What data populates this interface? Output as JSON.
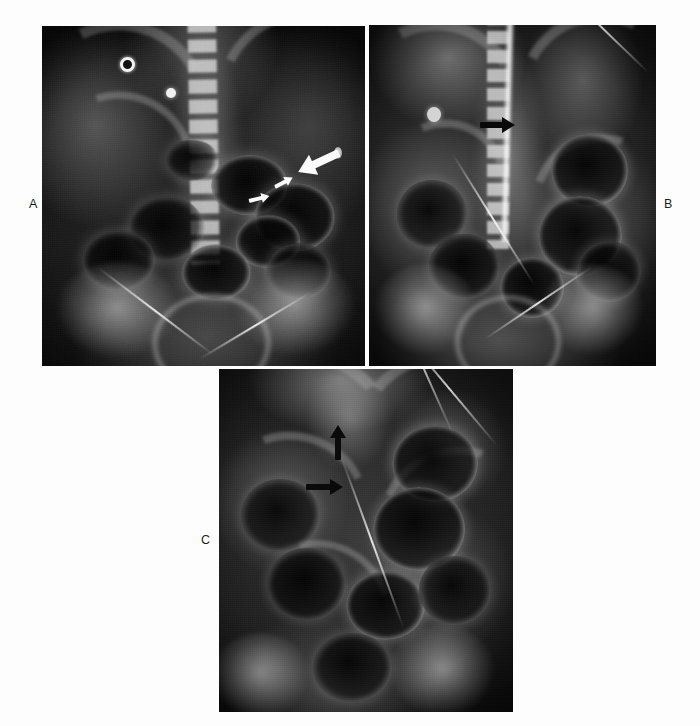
{
  "figure": {
    "type": "radiograph-panel-figure",
    "modality": "plain abdominal radiograph",
    "panel_count": 3,
    "background_color": "#fdfdfd",
    "caption_text": "",
    "caption_note": "caption line clipped at bottom page edge; text not legible"
  },
  "panels": [
    {
      "id": "A",
      "label": "A",
      "label_position": "left-of-image",
      "view": "supine abdomen, anteroposterior",
      "annotations": [
        {
          "kind": "arrow",
          "color": "white",
          "size": "large",
          "direction": "down-left",
          "target": "dilated bowel loop"
        },
        {
          "kind": "arrow",
          "color": "white",
          "size": "small",
          "direction": "right",
          "target": "air-fluid level"
        },
        {
          "kind": "arrow",
          "color": "white",
          "size": "small",
          "direction": "up-right",
          "target": "air-fluid level"
        }
      ],
      "markers": [
        {
          "kind": "ring-marker",
          "description": "annular radiopaque skin marker"
        },
        {
          "kind": "dot-marker",
          "description": "solid radiopaque skin marker"
        },
        {
          "kind": "oval-marker",
          "description": "small oval opacity, right flank"
        }
      ]
    },
    {
      "id": "B",
      "label": "B",
      "label_position": "right-of-image",
      "view": "abdomen with contrast-filled midline column and catheter",
      "annotations": [
        {
          "kind": "arrow",
          "color": "black",
          "size": "medium",
          "direction": "right",
          "target": "contrast column"
        }
      ],
      "markers": [
        {
          "kind": "dot-marker",
          "description": "rounded opacity, left upper quadrant"
        }
      ]
    },
    {
      "id": "C",
      "label": "C",
      "label_position": "left-of-image",
      "view": "coned abdomen with catheter",
      "annotations": [
        {
          "kind": "arrow",
          "color": "black",
          "size": "medium",
          "direction": "up",
          "target": "proximal finding"
        },
        {
          "kind": "arrow",
          "color": "black",
          "size": "medium",
          "direction": "right",
          "target": "distal finding"
        }
      ],
      "markers": []
    }
  ]
}
